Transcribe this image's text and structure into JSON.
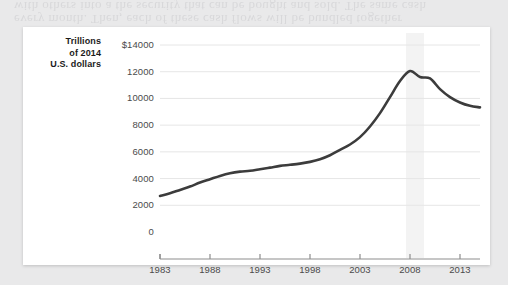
{
  "figure": {
    "panel_background": "#ffffff",
    "page_background": "#e9e9ea",
    "bleed_text_line1": "with others into a the security that can be bought and sold. The same cash",
    "bleed_text_line2": "every month. Then, each of these cash flows will be bundled together"
  },
  "chart_data": {
    "type": "line",
    "title": "",
    "subtitle": "",
    "xlabel": "",
    "ylabel": "Trillions of 2014 U.S. dollars",
    "ylabel_lines": [
      "Trillions",
      "of 2014",
      "U.S. dollars"
    ],
    "y_tick_labels": [
      "$14000",
      "12000",
      "10000",
      "8000",
      "6000",
      "4000",
      "2000",
      "0"
    ],
    "y_ticks": [
      14000,
      12000,
      10000,
      8000,
      6000,
      4000,
      2000,
      0
    ],
    "ylim": [
      0,
      14000
    ],
    "x_tick_labels": [
      "1983",
      "1988",
      "1993",
      "1998",
      "2003",
      "2008",
      "2013"
    ],
    "x_ticks": [
      1983,
      1988,
      1993,
      1998,
      2003,
      2008,
      2013
    ],
    "xlim": [
      1983,
      2015
    ],
    "grid": "horizontal",
    "legend": "none",
    "line_color": "#3c3c3c",
    "line_width": 2.6,
    "grid_color": "#e6e6e6",
    "axis_color": "#8e8e8e",
    "shaded_band": {
      "label": "recession",
      "x_start": 2007.6,
      "x_end": 2009.4,
      "color": "#f3f3f3"
    },
    "x": [
      1983,
      1984,
      1985,
      1986,
      1987,
      1988,
      1989,
      1990,
      1991,
      1992,
      1993,
      1994,
      1995,
      1996,
      1997,
      1998,
      1999,
      2000,
      2001,
      2002,
      2003,
      2004,
      2005,
      2006,
      2007,
      2008,
      2009,
      2010,
      2011,
      2012,
      2013,
      2014,
      2015
    ],
    "values": [
      2700,
      2900,
      3150,
      3400,
      3700,
      3950,
      4200,
      4400,
      4520,
      4580,
      4700,
      4820,
      4950,
      5030,
      5120,
      5250,
      5450,
      5750,
      6150,
      6550,
      7100,
      7900,
      8900,
      10100,
      11300,
      12050,
      11600,
      11500,
      10700,
      10100,
      9700,
      9450,
      9330
    ],
    "series": [
      {
        "name": "Household debt",
        "values": [
          2700,
          2900,
          3150,
          3400,
          3700,
          3950,
          4200,
          4400,
          4520,
          4580,
          4700,
          4820,
          4950,
          5030,
          5120,
          5250,
          5450,
          5750,
          6150,
          6550,
          7100,
          7900,
          8900,
          10100,
          11300,
          12050,
          11600,
          11500,
          10700,
          10100,
          9700,
          9450,
          9330
        ]
      }
    ]
  }
}
